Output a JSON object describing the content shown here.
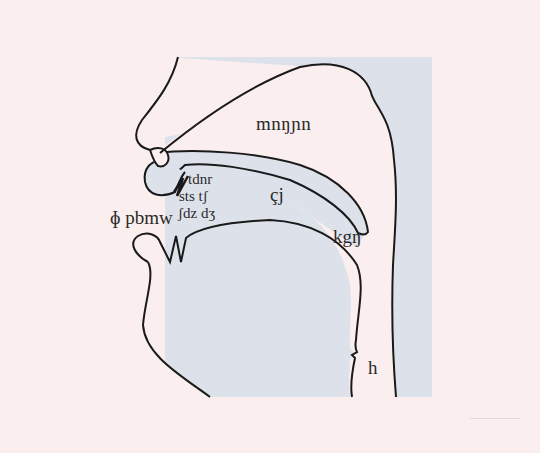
{
  "diagram": {
    "colors": {
      "background": "#fbeeee",
      "tract_fill": "#dde2ea",
      "outline": "#1a1a1a",
      "text": "#2a2a2a"
    },
    "labels": {
      "nasal": "mnŋɲn",
      "alveolar_row1": "tdnr",
      "alveolar_row2": "sts tʃ",
      "alveolar_row3": "ʃdz dʒ",
      "labial": "ɸ pbmw",
      "palatal": "çj",
      "velar": "kgŋ",
      "glottal": "h"
    }
  }
}
